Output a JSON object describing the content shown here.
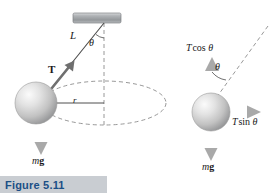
{
  "figure": {
    "caption": "Figure 5.11",
    "caption_bg": "#c9cdd2",
    "caption_color": "#1b4f86"
  },
  "colors": {
    "ink": "#1a1a1a",
    "ceiling": "#9a9da0",
    "sphere_light": "#f2f2f2",
    "sphere_mid": "#c9c9c9",
    "sphere_dark": "#8d8d8d",
    "arrow_gray": "#b3b3b3",
    "dash": "#8c8c8c"
  },
  "left_panel": {
    "name": "conical-pendulum-diagram",
    "ceiling_support": "ceiling-bar",
    "string_label": "L",
    "angle_label": "θ",
    "tension_label": "T",
    "radius_label": "r",
    "weight_label_m": "m",
    "weight_label_g": "g",
    "path": "dashed-ellipse-circular-path",
    "vertical_axis": "dashed-vertical-axis"
  },
  "right_panel": {
    "name": "free-body-diagram",
    "vertical_component_T": "T",
    "vertical_component_fn": "cos",
    "vertical_component_theta": "θ",
    "horizontal_component_T": "T",
    "horizontal_component_fn": "sin",
    "horizontal_component_theta": "θ",
    "angle_label": "θ",
    "weight_label_m": "m",
    "weight_label_g": "g",
    "string_direction": "dashed-string-line"
  }
}
